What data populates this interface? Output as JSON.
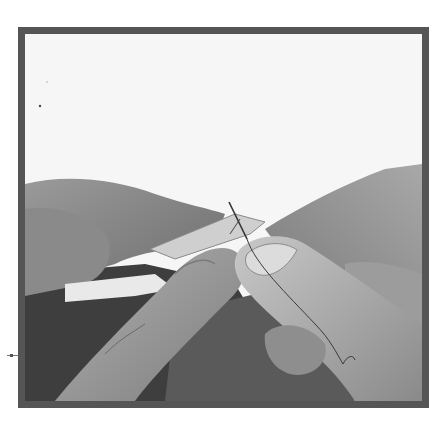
{
  "image": {
    "subject": "hands-sewing-with-needle-and-thread",
    "alt": "Close-up of two hands holding a folded fabric edge and pulling a needle and thread through it",
    "style": "grayscale photograph",
    "frame_color": "#555555",
    "background_color": "#f6f6f6"
  }
}
